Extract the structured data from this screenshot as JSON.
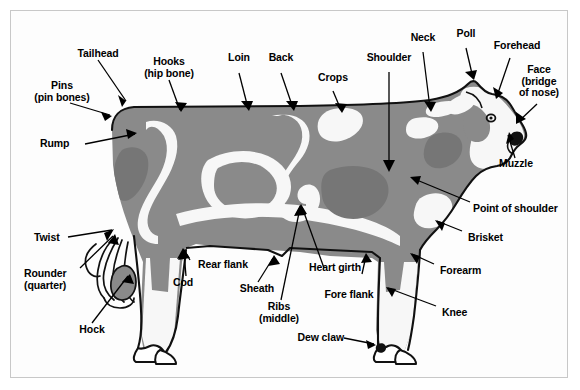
{
  "colors": {
    "body_gray": "#8a8a8a",
    "body_gray_dark": "#767676",
    "patch_white": "#f7f7f7",
    "outline": "#111111",
    "background": "#fdfdfd",
    "frame_border": "#c8c8c8",
    "text": "#000000"
  },
  "figure": {
    "orientation": "facing-right"
  },
  "labels": [
    {
      "id": "tailhead",
      "text": "Tailhead",
      "align": "center"
    },
    {
      "id": "pins",
      "text": "Pins\n(pin bones)",
      "align": "center"
    },
    {
      "id": "rump",
      "text": "Rump",
      "align": "left"
    },
    {
      "id": "hooks",
      "text": "Hooks\n(hip bone)",
      "align": "center"
    },
    {
      "id": "loin",
      "text": "Loin",
      "align": "center"
    },
    {
      "id": "back",
      "text": "Back",
      "align": "center"
    },
    {
      "id": "crops",
      "text": "Crops",
      "align": "center"
    },
    {
      "id": "shoulder",
      "text": "Shoulder",
      "align": "center"
    },
    {
      "id": "neck",
      "text": "Neck",
      "align": "center"
    },
    {
      "id": "poll",
      "text": "Poll",
      "align": "center"
    },
    {
      "id": "forehead",
      "text": "Forehead",
      "align": "center"
    },
    {
      "id": "face",
      "text": "Face\n(bridge\nof nose)",
      "align": "center"
    },
    {
      "id": "muzzle",
      "text": "Muzzle",
      "align": "center"
    },
    {
      "id": "point-of-shoulder",
      "text": "Point of shoulder",
      "align": "left"
    },
    {
      "id": "brisket",
      "text": "Brisket",
      "align": "left"
    },
    {
      "id": "forearm",
      "text": "Forearm",
      "align": "left"
    },
    {
      "id": "knee",
      "text": "Knee",
      "align": "left"
    },
    {
      "id": "dew-claw",
      "text": "Dew claw",
      "align": "right"
    },
    {
      "id": "fore-flank",
      "text": "Fore flank",
      "align": "center"
    },
    {
      "id": "heart-girth",
      "text": "Heart girth",
      "align": "center"
    },
    {
      "id": "ribs",
      "text": "Ribs\n(middle)",
      "align": "center"
    },
    {
      "id": "sheath",
      "text": "Sheath",
      "align": "center"
    },
    {
      "id": "cod",
      "text": "Cod",
      "align": "center"
    },
    {
      "id": "rear-flank",
      "text": "Rear flank",
      "align": "center"
    },
    {
      "id": "hock",
      "text": "Hock",
      "align": "center"
    },
    {
      "id": "rounder",
      "text": "Rounder\n(quarter)",
      "align": "left"
    },
    {
      "id": "twist",
      "text": "Twist",
      "align": "left"
    }
  ]
}
